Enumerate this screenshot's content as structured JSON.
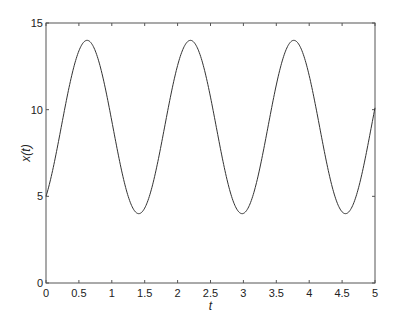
{
  "chart_data": {
    "type": "line",
    "title": "",
    "xlabel": "t",
    "ylabel": "x(t)",
    "xlim": [
      0,
      5
    ],
    "ylim": [
      0,
      15
    ],
    "xticks": [
      0,
      0.5,
      1,
      1.5,
      2,
      2.5,
      3,
      3.5,
      4,
      4.5,
      5
    ],
    "xtick_labels": [
      "0",
      "0.5",
      "1",
      "1.5",
      "2",
      "2.5",
      "3",
      "3.5",
      "4",
      "4.5",
      "5"
    ],
    "yticks": [
      0,
      5,
      10,
      15
    ],
    "ytick_labels": [
      "0",
      "5",
      "10",
      "15"
    ],
    "grid": false,
    "legend": null,
    "series": [
      {
        "name": "x(t)",
        "color": "#333333",
        "formula": "x(t) = 9 + 3 sin(4t) - 4 cos(4t)",
        "x": [
          0,
          0.25,
          0.5,
          0.62,
          0.75,
          1.0,
          1.25,
          1.41,
          1.5,
          1.75,
          2.0,
          2.2,
          2.25,
          2.5,
          2.75,
          2.98,
          3.0,
          3.25,
          3.5,
          3.77,
          4.0,
          4.25,
          4.55,
          4.75,
          5.0
        ],
        "values": [
          5.0,
          9.36,
          13.39,
          14.0,
          13.24,
          8.34,
          4.76,
          4.0,
          4.17,
          7.51,
          12.79,
          13.99,
          13.86,
          10.33,
          5.49,
          4.0,
          4.03,
          7.35,
          12.01,
          14.0,
          13.35,
          9.9,
          4.02,
          5.21,
          10.1
        ]
      }
    ]
  }
}
